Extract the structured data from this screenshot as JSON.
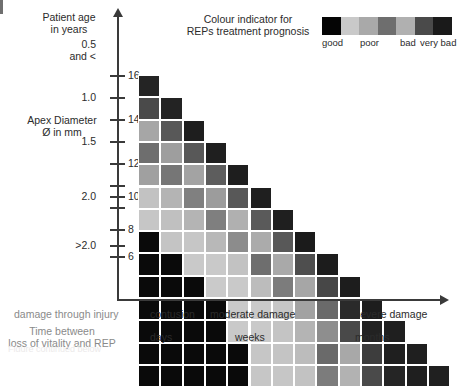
{
  "axes": {
    "y_primary_title": "Patient age\nin years",
    "y_secondary_title": "Apex Diameter\nØ in mm",
    "y_primary_ticks": [
      "0.5\nand <",
      "1.0",
      "1.5",
      "2.0",
      ">2.0"
    ],
    "y_secondary_ticks": [
      "16",
      "14",
      "12",
      "10",
      "8",
      "6"
    ],
    "x_caption_primary": "damage through injury",
    "x_caption_secondary": "Time between\nloss of vitality and REP",
    "x_damage_labels": [
      "contusion",
      "moderate damage",
      "severe damage"
    ],
    "x_time_labels": [
      "days",
      "weeks",
      "months"
    ]
  },
  "legend": {
    "title": "Colour indicator for\nREPs treatment prognosis",
    "labels": [
      "good",
      "poor",
      "bad",
      "very bad"
    ],
    "swatches": [
      "#050505",
      "#c9c9c9",
      "#a9a9a9",
      "#6e6e6e",
      "#b0b0b0",
      "#4a4a4a",
      "#1a1a1a"
    ]
  },
  "chart_data": {
    "type": "heatmap",
    "xlabel": "damage through injury / time between loss of vitality and REP",
    "ylabel": "Patient age in years / Apex Diameter Ø in mm",
    "grid": false,
    "legend_position": "top-right",
    "cell_size": 22.3,
    "columns": 14,
    "rows": 14,
    "palette_note": "greyscale: near-black = good, light grey = poor, mid grey = bad, dark grey = very bad",
    "x": [
      "1",
      "2",
      "3",
      "4",
      "5",
      "6",
      "7",
      "8",
      "9",
      "10",
      "11",
      "12",
      "13",
      "14"
    ],
    "y": [
      "16",
      "15",
      "14",
      "13",
      "12",
      "11",
      "10",
      "9",
      "8",
      "7",
      "6",
      "5",
      "4",
      "3"
    ],
    "colors": [
      [
        "#242424",
        null,
        null,
        null,
        null,
        null,
        null,
        null,
        null,
        null,
        null,
        null,
        null,
        null
      ],
      [
        "#4a4a4a",
        "#232323",
        null,
        null,
        null,
        null,
        null,
        null,
        null,
        null,
        null,
        null,
        null,
        null
      ],
      [
        "#a6a6a6",
        "#585858",
        "#1e1e1e",
        null,
        null,
        null,
        null,
        null,
        null,
        null,
        null,
        null,
        null,
        null
      ],
      [
        "#6e6e6e",
        "#9e9e9e",
        "#585858",
        "#1f1f1f",
        null,
        null,
        null,
        null,
        null,
        null,
        null,
        null,
        null,
        null
      ],
      [
        "#a0a0a0",
        "#767676",
        "#a3a3a3",
        "#5d5d5d",
        "#1e1e1e",
        null,
        null,
        null,
        null,
        null,
        null,
        null,
        null,
        null
      ],
      [
        "#c2c2c2",
        "#b4b4b4",
        "#808080",
        "#9c9c9c",
        "#585858",
        "#1f1f1f",
        null,
        null,
        null,
        null,
        null,
        null,
        null,
        null
      ],
      [
        "#c6c6c6",
        "#c0c0c0",
        "#b4b4b4",
        "#7f7f7f",
        "#b0b0b0",
        "#5a5a5a",
        "#1f1f1f",
        null,
        null,
        null,
        null,
        null,
        null,
        null
      ],
      [
        "#0a0a0a",
        "#c4c4c4",
        "#c6c6c6",
        "#b8b8b8",
        "#8c8c8c",
        "#ababab",
        "#585858",
        "#1b1b1b",
        null,
        null,
        null,
        null,
        null,
        null
      ],
      [
        "#0a0a0a",
        "#0a0a0a",
        "#c9c9c9",
        "#c9c9c9",
        "#c2c2c2",
        "#6e6e6e",
        "#a9a9a9",
        "#4e4e4e",
        "#1c1c1c",
        null,
        null,
        null,
        null,
        null
      ],
      [
        "#0a0a0a",
        "#0a0a0a",
        "#0a0a0a",
        "#cacaca",
        "#c9c9c9",
        "#bcbcbc",
        "#7c7c7c",
        "#a6a6a6",
        "#474747",
        "#1d1d1d",
        null,
        null,
        null,
        null
      ],
      [
        "#0a0a0a",
        "#0a0a0a",
        "#0a0a0a",
        "#0a0a0a",
        "#c9c9c9",
        "#c9c9c9",
        "#c6c6c6",
        "#a2a2a2",
        "#6a6a6a",
        "#2a2a2a",
        "#1d1d1d",
        null,
        null,
        null
      ],
      [
        "#0a0a0a",
        "#0a0a0a",
        "#0a0a0a",
        "#0a0a0a",
        "#c9c9c9",
        "#c9c9c9",
        "#c4c4c4",
        "#b4b4b4",
        "#8e8e8e",
        "#494949",
        "#222222",
        "#1f1f1f",
        null,
        null
      ],
      [
        "#0a0a0a",
        "#0a0a0a",
        "#0a0a0a",
        "#0a0a0a",
        "#0a0a0a",
        "#c6c6c6",
        "#c4c4c4",
        "#bcbcbc",
        "#6a6a6a",
        "#a8a8a8",
        "#3d3d3d",
        "#1f1f1f",
        "#1f1f1f",
        null
      ],
      [
        "#0a0a0a",
        "#0a0a0a",
        "#0a0a0a",
        "#0a0a0a",
        "#0a0a0a",
        "#c6c6c6",
        "#c6c6c6",
        "#c2c2c2",
        "#7c7c7c",
        "#b2b2b2",
        "#4a4a4a",
        "#252525",
        "#1f1f1f",
        "#202020"
      ]
    ]
  },
  "ghost_caption": "Figure continued below"
}
